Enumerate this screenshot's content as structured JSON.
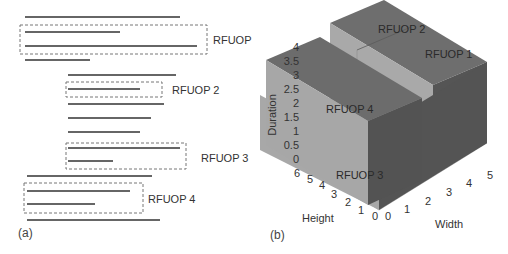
{
  "panel_a": {
    "caption": "(a)",
    "lines": [
      {
        "x1": 25,
        "x2": 180,
        "y": 17
      },
      {
        "x1": 25,
        "x2": 120,
        "y": 32
      },
      {
        "x1": 25,
        "x2": 197,
        "y": 46
      },
      {
        "x1": 25,
        "x2": 90,
        "y": 60
      },
      {
        "x1": 68,
        "x2": 176,
        "y": 75
      },
      {
        "x1": 68,
        "x2": 140,
        "y": 89
      },
      {
        "x1": 68,
        "x2": 164,
        "y": 104
      },
      {
        "x1": 68,
        "x2": 151,
        "y": 118
      },
      {
        "x1": 68,
        "x2": 140,
        "y": 132
      },
      {
        "x1": 68,
        "x2": 180,
        "y": 148
      },
      {
        "x1": 68,
        "x2": 113,
        "y": 161
      },
      {
        "x1": 27,
        "x2": 152,
        "y": 176
      },
      {
        "x1": 27,
        "x2": 130,
        "y": 191
      },
      {
        "x1": 27,
        "x2": 95,
        "y": 204
      },
      {
        "x1": 27,
        "x2": 160,
        "y": 220
      }
    ],
    "groups": [
      {
        "label": "RFUOP 1",
        "box": {
          "x": 20,
          "y": 25,
          "w": 187,
          "h": 29
        },
        "label_x": 213,
        "label_y": 44
      },
      {
        "label": "RFUOP 2",
        "box": {
          "x": 66,
          "y": 82,
          "w": 96,
          "h": 15
        },
        "label_x": 172,
        "label_y": 94
      },
      {
        "label": "RFUOP 3",
        "box": {
          "x": 66,
          "y": 143,
          "w": 120,
          "h": 26
        },
        "label_x": 201,
        "label_y": 162
      },
      {
        "label": "RFUOP 4",
        "box": {
          "x": 24,
          "y": 183,
          "w": 119,
          "h": 30
        },
        "label_x": 148,
        "label_y": 203
      }
    ]
  },
  "panel_b": {
    "caption": "(b)",
    "axes": {
      "z_label": "Duration",
      "x_label": "Width",
      "y_label": "Height",
      "z_ticks": [
        "0",
        "0.5",
        "1",
        "1.5",
        "2",
        "2.5",
        "3",
        "3.5",
        "4"
      ],
      "x_ticks": [
        "0",
        "1",
        "2",
        "3",
        "4",
        "5"
      ],
      "y_ticks": [
        "0",
        "1",
        "2",
        "3",
        "4",
        "5",
        "6"
      ]
    },
    "blocks": [
      {
        "label": "RFUOP 1"
      },
      {
        "label": "RFUOP 2"
      },
      {
        "label": "RFUOP 3"
      },
      {
        "label": "RFUOP 4"
      }
    ],
    "colors": {
      "top": "#6e6e6e",
      "left_face": "#a8a8a8",
      "right_face": "#555555",
      "axis": "#bbbbbb",
      "text": "#333333"
    }
  },
  "chart_data": {
    "type": "3d-bar",
    "title": "",
    "xlabel": "Width",
    "ylabel": "Height",
    "zlabel": "Duration",
    "xlim": [
      0,
      5
    ],
    "ylim": [
      0,
      6
    ],
    "zlim": [
      0,
      4
    ],
    "blocks": [
      {
        "name": "RFUOP 1",
        "width": [
          0,
          5
        ],
        "height": [
          0,
          2
        ],
        "duration": [
          0,
          4
        ]
      },
      {
        "name": "RFUOP 2",
        "width": [
          0,
          5
        ],
        "height": [
          2,
          3
        ],
        "duration": [
          2,
          4
        ]
      },
      {
        "name": "RFUOP 3",
        "width": [
          0,
          5
        ],
        "height": [
          3,
          6
        ],
        "duration": [
          0,
          2
        ]
      },
      {
        "name": "RFUOP 4",
        "width": [
          0,
          5
        ],
        "height": [
          3,
          6
        ],
        "duration": [
          2,
          3.5
        ]
      }
    ]
  }
}
